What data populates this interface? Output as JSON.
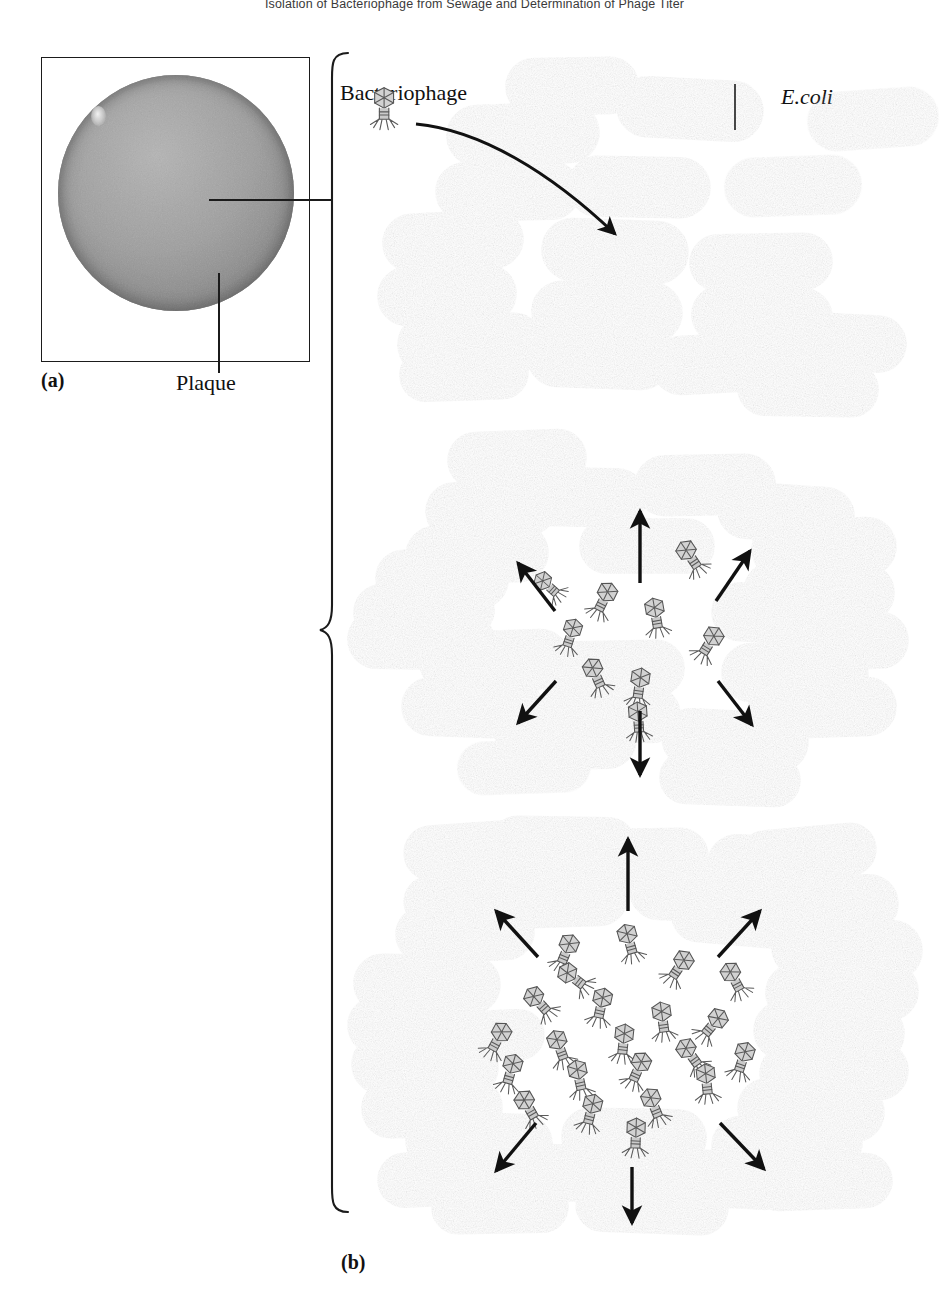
{
  "running_head": "Isolation of Bacteriophage from Sewage and Determination of Phage Titer",
  "figure": {
    "panel_a": {
      "label": "(a)",
      "caption_label": "Plaque",
      "description": "Photograph of an agar plate showing a circular bacterial lawn with a plaque"
    },
    "panel_b": {
      "label": "(b)",
      "labels": {
        "bacteriophage": "Bacteriophage",
        "ecoli": "E.coli"
      },
      "stages": [
        {
          "name": "stage-1-infection",
          "description": "Confluent lawn of E.coli cells; a single bacteriophage infects one cell",
          "bacteria_count": 19,
          "phage_count": 1,
          "clearing_radius": 0
        },
        {
          "name": "stage-2-small-plaque",
          "description": "Released phages lyse neighbouring cells forming a small clearing",
          "bacteria_count": 24,
          "phage_count": 9,
          "clearing_radius": 95
        },
        {
          "name": "stage-3-large-plaque",
          "description": "Repeated cycles of lysis enlarge the clearing into a visible plaque",
          "bacteria_count": 30,
          "phage_count": 22,
          "clearing_radius": 160
        }
      ]
    },
    "colors": {
      "bacteria_fill": "#b4b4b4",
      "bacteria_edge": "#8c8c8c",
      "bacteria_shadow": "#8f8f8f",
      "phage_fill": "#cfcfcf",
      "phage_stroke": "#5d5d5d",
      "arrow": "#111111",
      "plate_gray": "#9e9e9e",
      "ink": "#1b1b1b",
      "background": "#ffffff"
    }
  }
}
